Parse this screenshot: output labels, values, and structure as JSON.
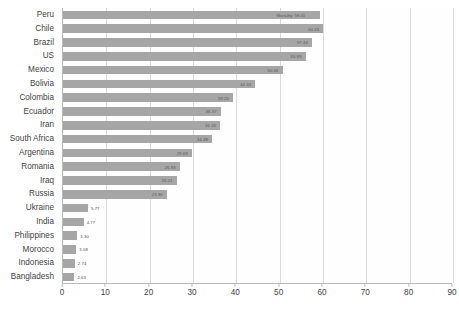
{
  "chart_data": {
    "type": "bar",
    "orientation": "horizontal",
    "title": "",
    "subtitle": "",
    "xlabel": "",
    "ylabel": "",
    "xlim": [
      0,
      90
    ],
    "xticks": [
      0,
      10,
      20,
      30,
      40,
      50,
      60,
      70,
      80,
      90
    ],
    "grid": true,
    "legend": false,
    "legend_position": "none",
    "bar_color": "#a6a6a6",
    "categories": [
      "Peru",
      "Chile",
      "Brazil",
      "US",
      "Mexico",
      "Bolivia",
      "Colombia",
      "Ecuador",
      "Iran",
      "South Africa",
      "Argentina",
      "Romania",
      "Iraq",
      "Russia",
      "Ukraine",
      "India",
      "Philippines",
      "Morocco",
      "Indonesia",
      "Bangladesh"
    ],
    "values": [
      59.41,
      60.03,
      57.44,
      55.99,
      50.66,
      44.34,
      39.2,
      36.37,
      36.24,
      34.38,
      29.69,
      26.93,
      26.21,
      23.96,
      5.77,
      4.77,
      3.3,
      3.08,
      2.74,
      2.63
    ],
    "value_labels": [
      "",
      "60.03",
      "57.44",
      "55.99",
      "50.66",
      "44.34",
      "39.20",
      "36.37",
      "36.24",
      "34.38",
      "29.69",
      "26.93",
      "26.21",
      "23.96",
      "5.77",
      "4.77",
      "3.30",
      "3.08",
      "2.74",
      "2.63"
    ],
    "annotations": [
      {
        "category": "Peru",
        "text": "Mortality: 59.41"
      }
    ]
  },
  "axis": {
    "x_tick_labels": [
      "0",
      "10",
      "20",
      "30",
      "40",
      "50",
      "60",
      "70",
      "80",
      "90"
    ]
  }
}
